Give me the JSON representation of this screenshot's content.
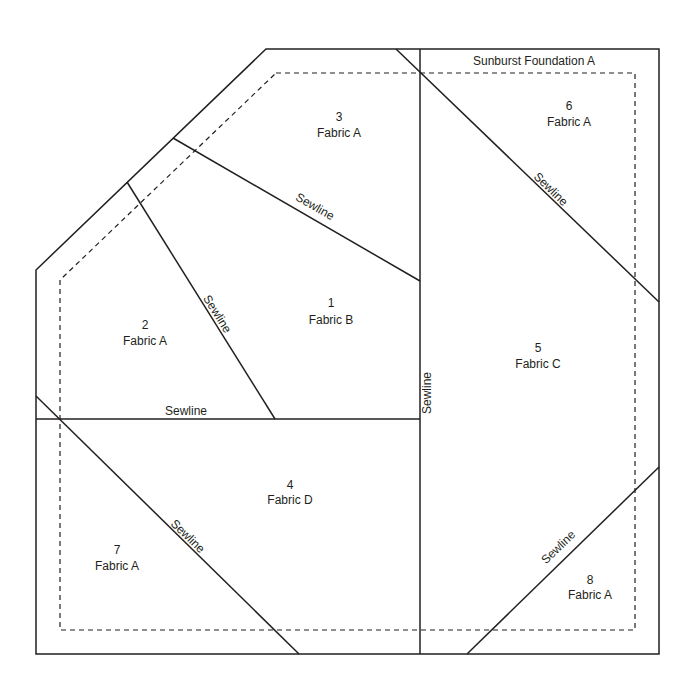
{
  "title": "Sunburst Foundation A",
  "colors": {
    "line": "#231f20",
    "background": "#ffffff"
  },
  "pieces": [
    {
      "number": "1",
      "fabric": "Fabric B"
    },
    {
      "number": "2",
      "fabric": "Fabric A"
    },
    {
      "number": "3",
      "fabric": "Fabric A"
    },
    {
      "number": "4",
      "fabric": "Fabric D"
    },
    {
      "number": "5",
      "fabric": "Fabric C"
    },
    {
      "number": "6",
      "fabric": "Fabric A"
    },
    {
      "number": "7",
      "fabric": "Fabric A"
    },
    {
      "number": "8",
      "fabric": "Fabric A"
    }
  ],
  "sewline_label": "Sewline"
}
